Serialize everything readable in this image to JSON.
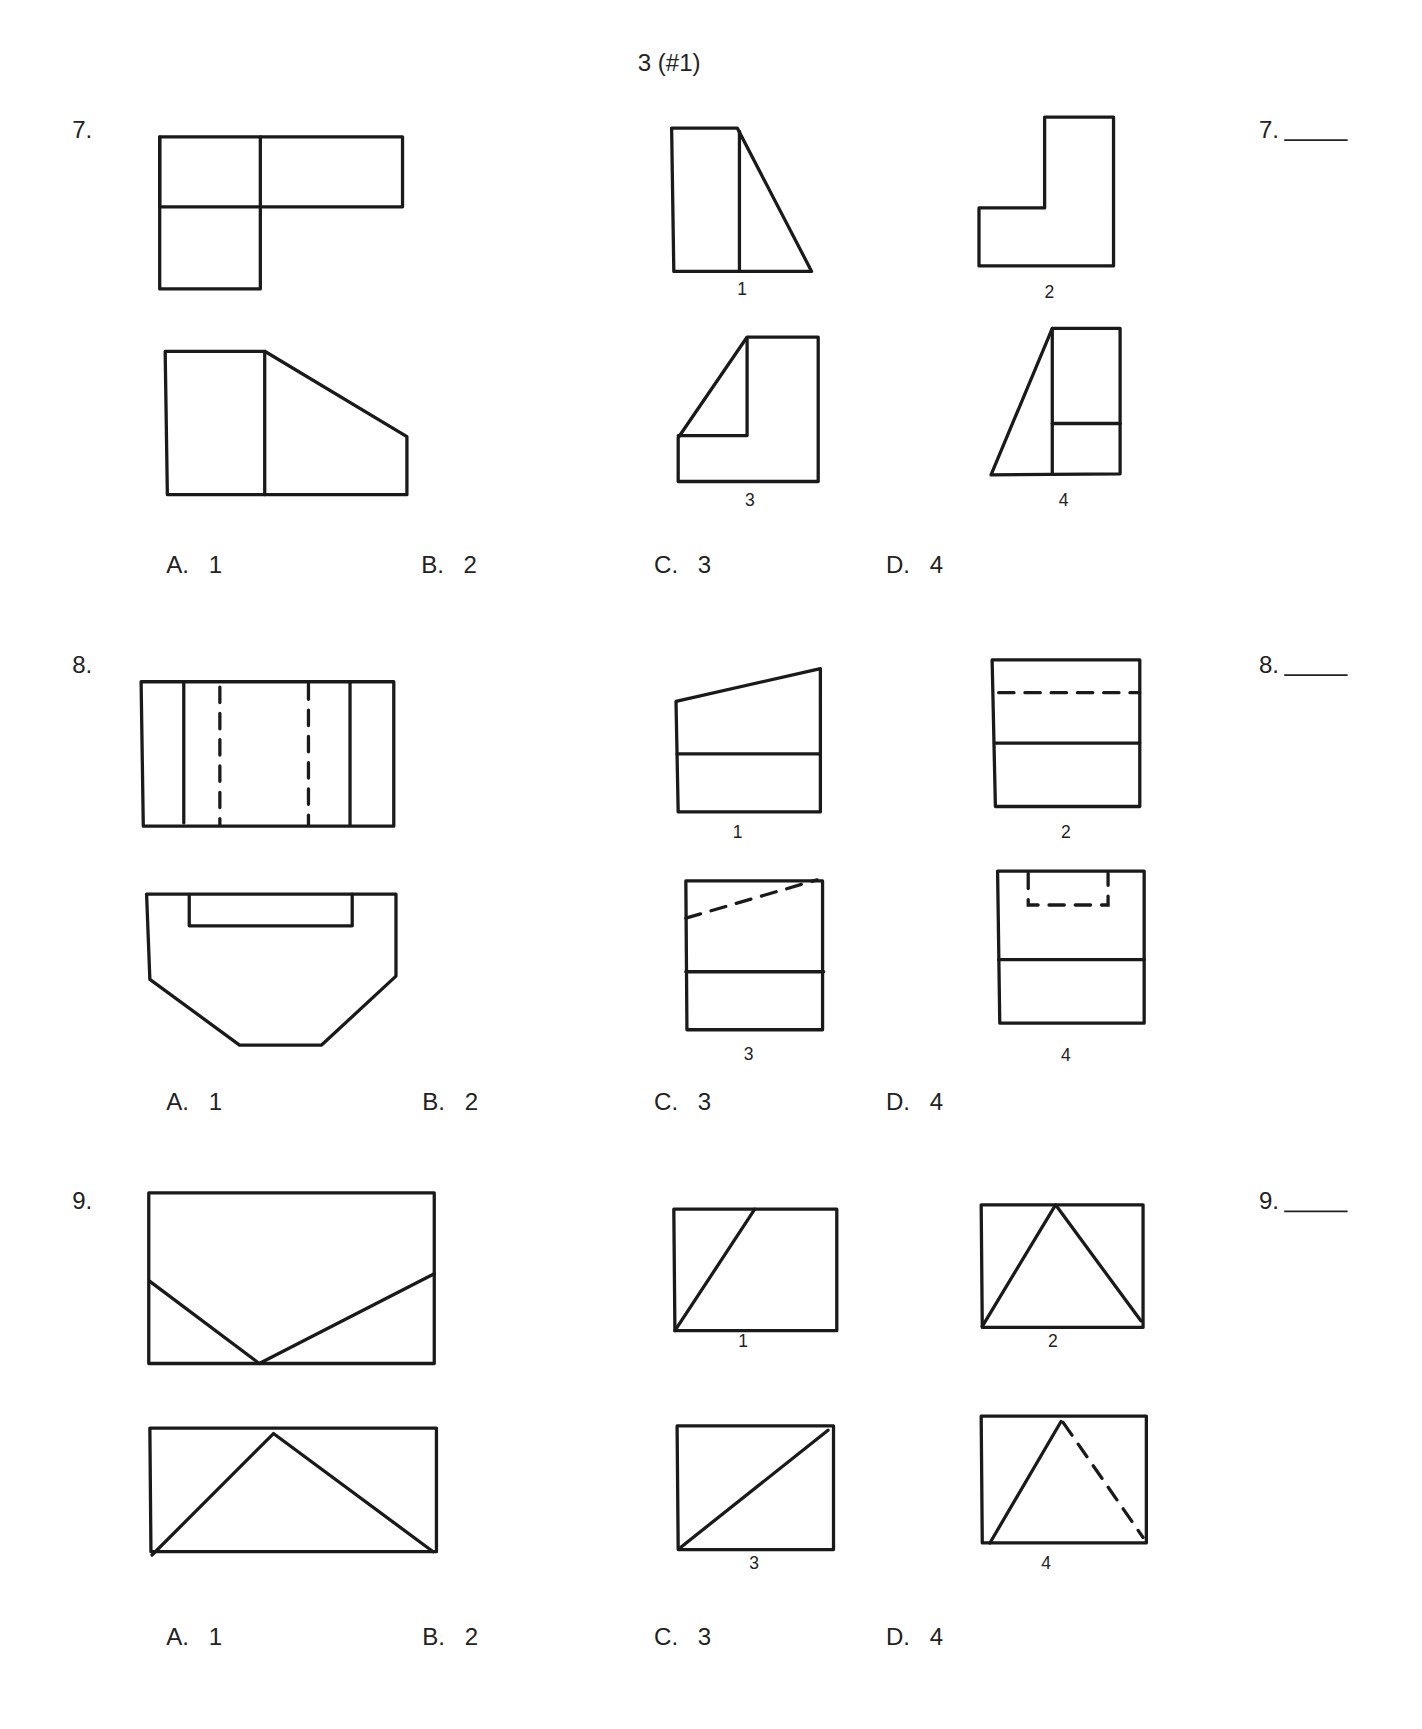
{
  "page_header": "3 (#1)",
  "questions": [
    {
      "number": "7.",
      "answer_label": "7.",
      "answer_blank": "",
      "figure_labels": [
        "1",
        "2",
        "3",
        "4"
      ],
      "options": [
        {
          "letter": "A.",
          "value": "1"
        },
        {
          "letter": "B.",
          "value": "2"
        },
        {
          "letter": "C.",
          "value": "3"
        },
        {
          "letter": "D.",
          "value": "4"
        }
      ]
    },
    {
      "number": "8.",
      "answer_label": "8.",
      "answer_blank": "",
      "figure_labels": [
        "1",
        "2",
        "3",
        "4"
      ],
      "options": [
        {
          "letter": "A.",
          "value": "1"
        },
        {
          "letter": "B.",
          "value": "2"
        },
        {
          "letter": "C.",
          "value": "3"
        },
        {
          "letter": "D.",
          "value": "4"
        }
      ]
    },
    {
      "number": "9.",
      "answer_label": "9.",
      "answer_blank": "",
      "figure_labels": [
        "1",
        "2",
        "3",
        "4"
      ],
      "options": [
        {
          "letter": "A.",
          "value": "1"
        },
        {
          "letter": "B.",
          "value": "2"
        },
        {
          "letter": "C.",
          "value": "3"
        },
        {
          "letter": "D.",
          "value": "4"
        }
      ]
    }
  ]
}
